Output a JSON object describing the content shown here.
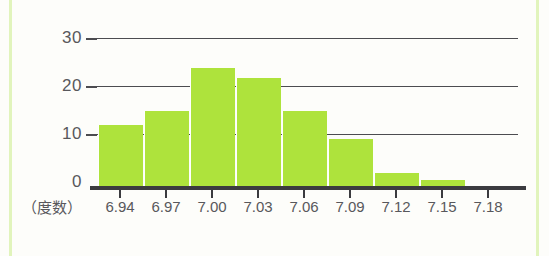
{
  "chart_data": {
    "type": "bar",
    "title": "",
    "subtitle": "",
    "xlabel": "",
    "ylabel": "",
    "y_axis_caption": "（度数）",
    "categories": [
      "6.94",
      "6.97",
      "7.00",
      "7.03",
      "7.06",
      "7.09",
      "7.12",
      "7.15",
      "7.18"
    ],
    "values": [
      13,
      16,
      25,
      23,
      16,
      10,
      3,
      1.5,
      0
    ],
    "yticks": [
      "0",
      "10",
      "20",
      "30"
    ],
    "ytick_values": [
      0,
      10,
      20,
      30
    ],
    "ylim": [
      0,
      33
    ],
    "grid": "horizontal",
    "gridline_values": [
      10,
      20,
      30
    ],
    "legend": "none",
    "bar_color": "#aee33c",
    "axis_color": "#3b3b3f",
    "gridline_color": "#4c4c50",
    "label_color": "#58585c",
    "background": "#fdfdfa"
  },
  "labels": {
    "y30": "30",
    "y20": "20",
    "y10": "10",
    "y0": "0",
    "frequency_caption": "（度数）"
  }
}
